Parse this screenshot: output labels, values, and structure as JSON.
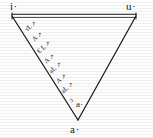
{
  "figure": {
    "kind": "vowel-triangle",
    "ink_color": "#1b1b1b",
    "background_color": "#fdfdfd",
    "geometry": {
      "left_vertex": {
        "x": 12,
        "y": 16
      },
      "right_vertex": {
        "x": 136,
        "y": 16
      },
      "apex_vertex": {
        "x": 78,
        "y": 120
      },
      "top_edge_is_double_ruled": true
    },
    "vertices": [
      {
        "id": "vertex-i",
        "label": "i·",
        "x": 10,
        "y": 1
      },
      {
        "id": "vertex-u",
        "label": "u·",
        "x": 126,
        "y": 1
      },
      {
        "id": "vertex-a",
        "label": "a·",
        "x": 70,
        "y": 124
      }
    ],
    "interior_labels": [
      {
        "id": "interior-a",
        "label": "a·",
        "x": 76,
        "y": 100
      }
    ],
    "annotations": [
      {
        "id": "annot-1",
        "text": "τL",
        "mark": "↗",
        "x": 24,
        "y": 28,
        "rotate": -40
      },
      {
        "id": "annot-2",
        "text": "A",
        "mark": "↗",
        "x": 31,
        "y": 38,
        "rotate": -40
      },
      {
        "id": "annot-3",
        "text": "€ L",
        "mark": "↗",
        "x": 36,
        "y": 50,
        "rotate": -40
      },
      {
        "id": "annot-4",
        "text": "A",
        "mark": "↗",
        "x": 43,
        "y": 60,
        "rotate": -40
      },
      {
        "id": "annot-5",
        "text": "aL",
        "mark": "↗",
        "x": 48,
        "y": 70,
        "rotate": -40
      },
      {
        "id": "annot-6",
        "text": "A",
        "mark": "↗",
        "x": 55,
        "y": 80,
        "rotate": -40
      },
      {
        "id": "annot-7",
        "text": "aL",
        "mark": "↗",
        "x": 60,
        "y": 90,
        "rotate": -40
      },
      {
        "id": "annot-8",
        "text": "ɔ",
        "mark": "",
        "x": 68,
        "y": 99,
        "rotate": -40
      }
    ]
  }
}
